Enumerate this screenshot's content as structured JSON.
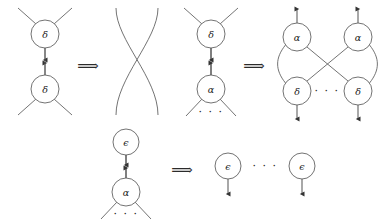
{
  "figure": {
    "background_color": "#ffffff",
    "stroke_color": "#555555",
    "text_color": "#1a1a1a",
    "width": 381,
    "height": 222,
    "implication_symbol": "⟹",
    "ellipsis_symbol": "· · ·",
    "rules": [
      {
        "name": "delta-delta-annihilation",
        "lhs": {
          "nodes": [
            {
              "id": "d1",
              "label": "δ",
              "cx": 45,
              "cy": 34,
              "r": 14
            },
            {
              "id": "d2",
              "label": "δ",
              "cx": 45,
              "cy": 89,
              "r": 14
            }
          ],
          "free_ports": [
            "top-left",
            "top-right",
            "bottom-left",
            "bottom-right"
          ]
        },
        "operator": {
          "label": "⟹",
          "x": 88,
          "y": 66
        },
        "rhs": {
          "kind": "wire-crossing",
          "description": "two crossing wires"
        }
      },
      {
        "name": "delta-alpha-commutation",
        "lhs": {
          "nodes": [
            {
              "id": "d3",
              "label": "δ",
              "cx": 211,
              "cy": 34,
              "r": 14
            },
            {
              "id": "a1",
              "label": "α",
              "cx": 211,
              "cy": 89,
              "r": 14
            }
          ],
          "ellipsis": {
            "label": "· · ·",
            "x": 211,
            "y": 113
          }
        },
        "operator": {
          "label": "⟹",
          "x": 254,
          "y": 66
        },
        "rhs": {
          "nodes": [
            {
              "id": "a2",
              "label": "α",
              "cx": 297,
              "cy": 37,
              "r": 14
            },
            {
              "id": "a3",
              "label": "α",
              "cx": 358,
              "cy": 37,
              "r": 14
            },
            {
              "id": "d4",
              "label": "δ",
              "cx": 297,
              "cy": 91,
              "r": 14
            },
            {
              "id": "d5",
              "label": "δ",
              "cx": 358,
              "cy": 91,
              "r": 14
            }
          ],
          "ellipsis": {
            "label": "· · ·",
            "x": 327,
            "y": 94
          },
          "arrows": [
            "up-left",
            "up-right",
            "down-left",
            "down-right"
          ]
        }
      },
      {
        "name": "epsilon-alpha-erasure",
        "lhs": {
          "nodes": [
            {
              "id": "e1",
              "label": "ϵ",
              "cx": 126,
              "cy": 142,
              "r": 13
            },
            {
              "id": "a4",
              "label": "α",
              "cx": 126,
              "cy": 192,
              "r": 14
            }
          ],
          "ellipsis": {
            "label": "· · ·",
            "x": 126,
            "y": 214
          }
        },
        "operator": {
          "label": "⟹",
          "x": 182,
          "y": 170
        },
        "rhs": {
          "nodes": [
            {
              "id": "e2",
              "label": "ϵ",
              "cx": 228,
              "cy": 166,
              "r": 13
            },
            {
              "id": "e3",
              "label": "ϵ",
              "cx": 302,
              "cy": 166,
              "r": 13
            }
          ],
          "ellipsis": {
            "label": "· · ·",
            "x": 265,
            "y": 168
          },
          "arrows": [
            "down",
            "down"
          ]
        }
      }
    ],
    "node_labels": {
      "delta": "δ",
      "alpha": "α",
      "epsilon": "ϵ"
    }
  }
}
